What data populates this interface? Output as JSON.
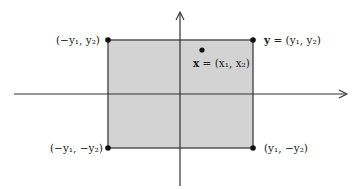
{
  "diagram": {
    "type": "coordinate-plane-rectangle",
    "colors": {
      "fill": "#d3d3d3",
      "edge": "#555555",
      "axis": "#333333",
      "point": "#111111"
    },
    "labels": {
      "top_left": "(−y₁, y₂)",
      "top_right": "y = (y₁, y₂)",
      "top_right_bold": "y",
      "top_right_rest": " = (y₁, y₂)",
      "interior": "x = (x₁, x₂)",
      "interior_bold": "x",
      "interior_rest": " = (x₁, x₂)",
      "bottom_left": "(−y₁, −y₂)",
      "bottom_right": "(y₁, −y₂)"
    },
    "points": [
      {
        "name": "top-left-corner",
        "x": 108,
        "y": 40
      },
      {
        "name": "top-right-corner",
        "x": 253,
        "y": 40
      },
      {
        "name": "bottom-left-corner",
        "x": 108,
        "y": 148
      },
      {
        "name": "bottom-right-corner",
        "x": 253,
        "y": 148
      },
      {
        "name": "interior-point",
        "x": 202,
        "y": 50
      }
    ]
  }
}
